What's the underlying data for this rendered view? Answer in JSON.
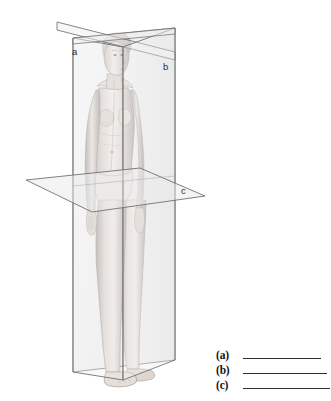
{
  "diagram": {
    "background_color": "#ffffff",
    "planes": [
      {
        "key": "a",
        "label": "a",
        "name": "sagittal-plane",
        "orientation": "vertical, divides body into left and right",
        "fill_color": "#f2f2f2",
        "stroke_color": "#6f6f6f"
      },
      {
        "key": "b",
        "label": "b",
        "name": "coronal-plane",
        "orientation": "vertical, divides body into anterior and posterior",
        "fill_color": "#ededed",
        "stroke_color": "#6f6f6f"
      },
      {
        "key": "c",
        "label": "c",
        "name": "transverse-plane",
        "orientation": "horizontal, divides body into superior and inferior",
        "fill_color": "#e9e9e9",
        "stroke_color": "#6f6f6f"
      }
    ],
    "figure": {
      "name": "human-body-illustration",
      "skin_light": "#f0ece9",
      "skin_mid": "#cfc8c4",
      "skin_shadow": "#a39b97",
      "outline": "#8d8680"
    }
  },
  "answer_key": {
    "name": "answer-key",
    "rows": [
      {
        "label": "(a)",
        "value": ""
      },
      {
        "label": "(b)",
        "value": ""
      },
      {
        "label": "(c)",
        "value": ""
      }
    ]
  }
}
